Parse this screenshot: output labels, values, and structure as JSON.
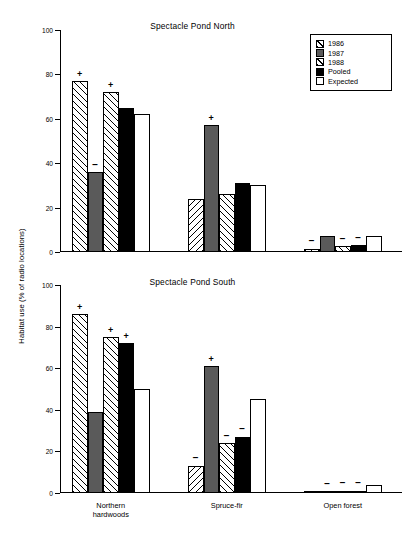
{
  "figure": {
    "ylabel": "Habitat use (% of radio locations)"
  },
  "legend": {
    "position": "top-right",
    "entries": [
      {
        "label": "1986",
        "swatch": "hatched-diagonal"
      },
      {
        "label": "1987",
        "swatch": "solid-gray"
      },
      {
        "label": "1988",
        "swatch": "hatched-diagonal"
      },
      {
        "label": "Pooled",
        "swatch": "solid-black"
      },
      {
        "label": "Expected",
        "swatch": "open-white"
      }
    ]
  },
  "chart_data": [
    {
      "type": "bar",
      "title": "Spectacle Pond North",
      "xlabel": "",
      "ylabel": "Habitat use (% of radio locations)",
      "ylim": [
        0,
        100
      ],
      "yticks": [
        0,
        20,
        40,
        60,
        80,
        100
      ],
      "grid": false,
      "categories": [
        "Northern hardwoods",
        "Spruce-fir",
        "Open forest"
      ],
      "series": [
        {
          "name": "1986",
          "values": [
            77,
            24,
            1.5
          ],
          "markers": [
            "+",
            "",
            "−"
          ]
        },
        {
          "name": "1987",
          "values": [
            36,
            57,
            7
          ],
          "markers": [
            "−",
            "+",
            ""
          ]
        },
        {
          "name": "1988",
          "values": [
            72,
            26,
            2.5
          ],
          "markers": [
            "+",
            "",
            "−"
          ]
        },
        {
          "name": "Pooled",
          "values": [
            65,
            31,
            3
          ],
          "markers": [
            "",
            "",
            "−"
          ]
        },
        {
          "name": "Expected",
          "values": [
            62,
            30,
            7
          ],
          "markers": [
            "",
            "",
            ""
          ]
        }
      ]
    },
    {
      "type": "bar",
      "title": "Spectacle Pond South",
      "xlabel": "",
      "ylabel": "Habitat use (% of radio locations)",
      "ylim": [
        0,
        100
      ],
      "yticks": [
        0,
        20,
        40,
        60,
        80,
        100
      ],
      "grid": false,
      "categories": [
        "Northern hardwoods",
        "Spruce-fir",
        "Open forest"
      ],
      "series": [
        {
          "name": "1986",
          "values": [
            86,
            13,
            0.5
          ],
          "markers": [
            "+",
            "−",
            ""
          ]
        },
        {
          "name": "1987",
          "values": [
            39,
            61,
            0.6
          ],
          "markers": [
            "",
            "+",
            "−"
          ]
        },
        {
          "name": "1988",
          "values": [
            75,
            24,
            1
          ],
          "markers": [
            "+",
            "−",
            "−"
          ]
        },
        {
          "name": "Pooled",
          "values": [
            72,
            27,
            1
          ],
          "markers": [
            "+",
            "−",
            "−"
          ]
        },
        {
          "name": "Expected",
          "values": [
            50,
            45,
            4
          ],
          "markers": [
            "",
            "",
            ""
          ]
        }
      ]
    }
  ]
}
